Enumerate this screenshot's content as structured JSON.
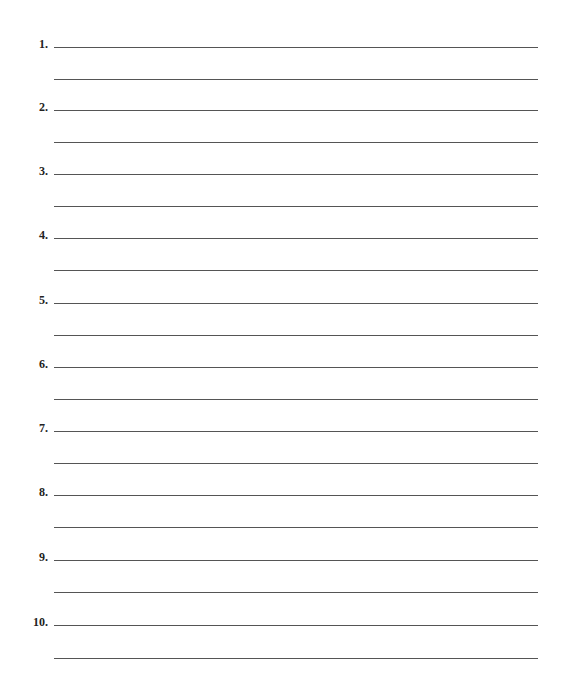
{
  "worksheet": {
    "items": [
      {
        "label": "1.",
        "answer_line_1": "",
        "answer_line_2": ""
      },
      {
        "label": "2.",
        "answer_line_1": "",
        "answer_line_2": ""
      },
      {
        "label": "3.",
        "answer_line_1": "",
        "answer_line_2": ""
      },
      {
        "label": "4.",
        "answer_line_1": "",
        "answer_line_2": ""
      },
      {
        "label": "5.",
        "answer_line_1": "",
        "answer_line_2": ""
      },
      {
        "label": "6.",
        "answer_line_1": "",
        "answer_line_2": ""
      },
      {
        "label": "7.",
        "answer_line_1": "",
        "answer_line_2": ""
      },
      {
        "label": "8.",
        "answer_line_1": "",
        "answer_line_2": ""
      },
      {
        "label": "9.",
        "answer_line_1": "",
        "answer_line_2": ""
      },
      {
        "label": "10.",
        "answer_line_1": "",
        "answer_line_2": ""
      }
    ]
  }
}
